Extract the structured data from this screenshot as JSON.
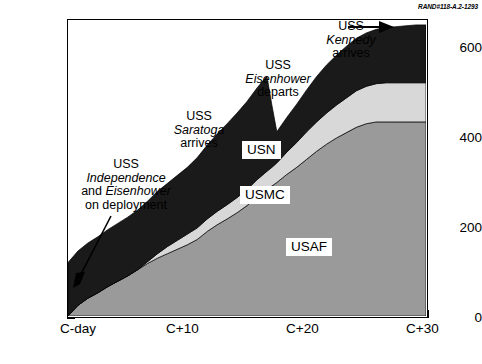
{
  "figure": {
    "rand_id": "RAND#118-A.2-1293",
    "source": "SOURCE:  Perrin (1992), p. 3."
  },
  "axes": {
    "ylabel": "Number of aircraft",
    "yticks": [
      "0",
      "200",
      "400",
      "600"
    ],
    "ytick_values": [
      0,
      200,
      400,
      600
    ],
    "ylim": [
      0,
      665
    ],
    "xticks": [
      "C-day",
      "C+10",
      "C+20",
      "C+30"
    ],
    "xtick_values": [
      0,
      10,
      20,
      30
    ],
    "xlim": [
      0,
      36
    ]
  },
  "series_tags": [
    {
      "label": "USN",
      "color": "#1a1a1a"
    },
    {
      "label": "USMC",
      "color": "#d8d8d8"
    },
    {
      "label": "USAF",
      "color": "#9a9a9a"
    }
  ],
  "annotations": [
    {
      "name": "independence-eisenhower",
      "lines": [
        {
          "parts": [
            {
              "text": "USS",
              "italic": false
            }
          ]
        },
        {
          "parts": [
            {
              "text": "Independence",
              "italic": true
            }
          ]
        },
        {
          "parts": [
            {
              "text": "and ",
              "italic": false
            },
            {
              "text": "Eisenhower",
              "italic": true
            }
          ]
        },
        {
          "parts": [
            {
              "text": "on deployment",
              "italic": false
            }
          ]
        }
      ]
    },
    {
      "name": "saratoga-arrives",
      "lines": [
        {
          "parts": [
            {
              "text": "USS",
              "italic": false
            }
          ]
        },
        {
          "parts": [
            {
              "text": "Saratoga",
              "italic": true
            }
          ]
        },
        {
          "parts": [
            {
              "text": "arrives",
              "italic": false
            }
          ]
        }
      ]
    },
    {
      "name": "eisenhower-departs",
      "lines": [
        {
          "parts": [
            {
              "text": "USS",
              "italic": false
            }
          ]
        },
        {
          "parts": [
            {
              "text": "Eisenhower",
              "italic": true
            }
          ]
        },
        {
          "parts": [
            {
              "text": "departs",
              "italic": false
            }
          ]
        }
      ]
    },
    {
      "name": "kennedy-arrives",
      "lines": [
        {
          "parts": [
            {
              "text": "USS",
              "italic": false
            }
          ]
        },
        {
          "parts": [
            {
              "text": "Kennedy",
              "italic": true
            }
          ]
        },
        {
          "parts": [
            {
              "text": "arrives",
              "italic": false
            }
          ]
        }
      ]
    }
  ],
  "chart_data": {
    "type": "area",
    "stacked": true,
    "title": "",
    "xlabel": "",
    "ylabel": "Number of aircraft",
    "xlim": [
      0,
      36
    ],
    "ylim": [
      0,
      665
    ],
    "grid": false,
    "legend": "inline-labels",
    "x": [
      0,
      1,
      2,
      3,
      4,
      5,
      6,
      7,
      8,
      9,
      10,
      11,
      12,
      13,
      14,
      15,
      16,
      17,
      18,
      19,
      20,
      20.5,
      21,
      22,
      23,
      24,
      25,
      26,
      27,
      28,
      29,
      30,
      31,
      32,
      33,
      34,
      35,
      36
    ],
    "series": [
      {
        "name": "USAF",
        "color": "#9a9a9a",
        "values": [
          0,
          24,
          40,
          52,
          66,
          78,
          90,
          104,
          118,
          130,
          140,
          150,
          160,
          172,
          190,
          205,
          218,
          232,
          248,
          268,
          285,
          292,
          300,
          318,
          334,
          352,
          370,
          386,
          400,
          412,
          424,
          432,
          436,
          436,
          436,
          436,
          436,
          436
        ]
      },
      {
        "name": "USMC",
        "color": "#d8d8d8",
        "values": [
          0,
          0,
          0,
          0,
          0,
          0,
          0,
          0,
          4,
          10,
          16,
          20,
          24,
          26,
          28,
          30,
          32,
          34,
          36,
          38,
          40,
          42,
          44,
          50,
          56,
          62,
          66,
          70,
          74,
          78,
          82,
          84,
          86,
          88,
          88,
          88,
          88,
          88
        ]
      },
      {
        "name": "USN",
        "color": "#1a1a1a",
        "values": [
          120,
          122,
          124,
          126,
          128,
          130,
          132,
          134,
          136,
          140,
          142,
          146,
          150,
          158,
          166,
          174,
          182,
          190,
          198,
          206,
          214,
          140,
          70,
          78,
          86,
          94,
          102,
          108,
          112,
          116,
          118,
          120,
          122,
          124,
          126,
          128,
          130,
          130
        ]
      }
    ],
    "totals": [
      120,
      146,
      164,
      178,
      194,
      208,
      222,
      238,
      258,
      280,
      298,
      316,
      334,
      356,
      384,
      409,
      432,
      456,
      482,
      512,
      539,
      474,
      414,
      446,
      476,
      508,
      538,
      564,
      586,
      606,
      624,
      636,
      644,
      648,
      650,
      652,
      654,
      654
    ]
  }
}
